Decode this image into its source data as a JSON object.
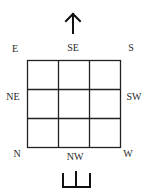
{
  "diagram": {
    "title": "",
    "labels": {
      "top_left": "E",
      "top_center": "SE",
      "top_right": "S",
      "middle_left": "NE",
      "middle_right": "SW",
      "bottom_left": "N",
      "bottom_center": "NW",
      "bottom_right": "W"
    },
    "grid": {
      "rows": 3,
      "cols": 3
    },
    "top_symbol": "up-arrow",
    "bottom_symbol": "bracket-shape",
    "colors": {
      "line": "#222222",
      "background": "#ffffff"
    }
  }
}
